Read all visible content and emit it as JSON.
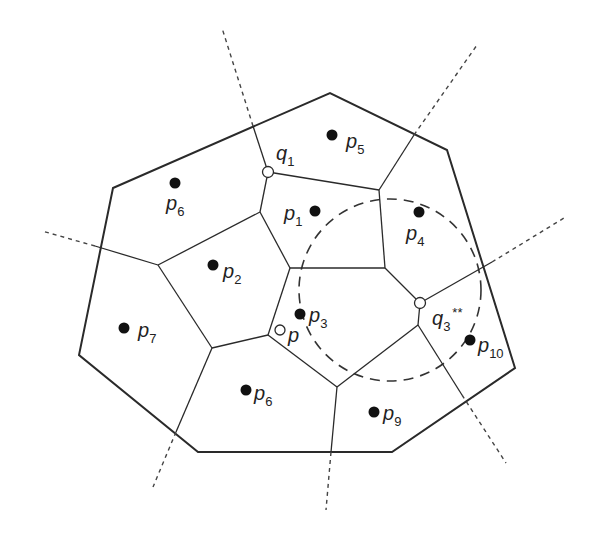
{
  "diagram": {
    "type": "voronoi",
    "colors": {
      "line": "#2a2a2a",
      "background": "#ffffff"
    },
    "sites": [
      {
        "id": "p5",
        "base": "p",
        "sub": "5",
        "x": 332,
        "y": 135,
        "lx": 346,
        "ly": 148
      },
      {
        "id": "p6a",
        "base": "p",
        "sub": "6",
        "x": 175,
        "y": 183,
        "lx": 166,
        "ly": 210
      },
      {
        "id": "p1",
        "base": "p",
        "sub": "1",
        "x": 315,
        "y": 211,
        "lx": 284,
        "ly": 220
      },
      {
        "id": "p4",
        "base": "p",
        "sub": "4",
        "x": 419,
        "y": 212,
        "lx": 406,
        "ly": 240
      },
      {
        "id": "p2",
        "base": "p",
        "sub": "2",
        "x": 213,
        "y": 265,
        "lx": 223,
        "ly": 278
      },
      {
        "id": "p3",
        "base": "p",
        "sub": "3",
        "x": 300,
        "y": 314,
        "lx": 309,
        "ly": 322
      },
      {
        "id": "p7",
        "base": "p",
        "sub": "7",
        "x": 124,
        "y": 328,
        "lx": 138,
        "ly": 337
      },
      {
        "id": "p10",
        "base": "p",
        "sub": "10",
        "x": 470,
        "y": 340,
        "lx": 478,
        "ly": 352
      },
      {
        "id": "p6b",
        "base": "p",
        "sub": "6",
        "x": 246,
        "y": 390,
        "lx": 254,
        "ly": 400
      },
      {
        "id": "p9",
        "base": "p",
        "sub": "9",
        "x": 374,
        "y": 412,
        "lx": 383,
        "ly": 420
      }
    ],
    "query_points": [
      {
        "id": "p",
        "label": "p",
        "x": 280,
        "y": 330,
        "lx": 288,
        "ly": 342
      }
    ],
    "vertices_marked": [
      {
        "id": "q1",
        "base": "q",
        "sub": "1",
        "sup": "",
        "x": 268,
        "y": 172,
        "lx": 276,
        "ly": 160
      },
      {
        "id": "q3",
        "base": "q",
        "sub": "3",
        "sup": "**",
        "x": 420,
        "y": 303,
        "lx": 432,
        "ly": 325
      }
    ],
    "hull_polygon": [
      [
        113,
        188
      ],
      [
        330,
        93
      ],
      [
        447,
        150
      ],
      [
        515,
        368
      ],
      [
        392,
        452
      ],
      [
        198,
        452
      ],
      [
        79,
        355
      ]
    ],
    "edges": [
      [
        [
          268,
          172
        ],
        [
          253,
          126
        ]
      ],
      [
        [
          268,
          172
        ],
        [
          379,
          190
        ]
      ],
      [
        [
          379,
          190
        ],
        [
          414,
          135
        ]
      ],
      [
        [
          268,
          172
        ],
        [
          260,
          212
        ]
      ],
      [
        [
          260,
          212
        ],
        [
          158,
          265
        ]
      ],
      [
        [
          158,
          265
        ],
        [
          95,
          246
        ]
      ],
      [
        [
          260,
          212
        ],
        [
          290,
          268
        ]
      ],
      [
        [
          379,
          190
        ],
        [
          385,
          268
        ]
      ],
      [
        [
          290,
          268
        ],
        [
          385,
          268
        ]
      ],
      [
        [
          385,
          268
        ],
        [
          420,
          303
        ]
      ],
      [
        [
          420,
          303
        ],
        [
          492,
          262
        ]
      ],
      [
        [
          290,
          268
        ],
        [
          268,
          335
        ]
      ],
      [
        [
          158,
          265
        ],
        [
          212,
          348
        ]
      ],
      [
        [
          212,
          348
        ],
        [
          268,
          335
        ]
      ],
      [
        [
          212,
          348
        ],
        [
          176,
          432
        ]
      ],
      [
        [
          268,
          335
        ],
        [
          337,
          387
        ]
      ],
      [
        [
          337,
          387
        ],
        [
          418,
          325
        ]
      ],
      [
        [
          418,
          325
        ],
        [
          420,
          303
        ]
      ],
      [
        [
          337,
          387
        ],
        [
          331,
          452
        ]
      ],
      [
        [
          418,
          325
        ],
        [
          462,
          395
        ]
      ]
    ],
    "dashed_rays": [
      [
        [
          253,
          126
        ],
        [
          222,
          28
        ]
      ],
      [
        [
          414,
          135
        ],
        [
          477,
          45
        ]
      ],
      [
        [
          95,
          246
        ],
        [
          42,
          231
        ]
      ],
      [
        [
          492,
          262
        ],
        [
          564,
          218
        ]
      ],
      [
        [
          462,
          395
        ],
        [
          506,
          463
        ]
      ],
      [
        [
          331,
          452
        ],
        [
          326,
          510
        ]
      ],
      [
        [
          176,
          432
        ],
        [
          153,
          487
        ]
      ]
    ],
    "circle": {
      "cx": 390,
      "cy": 290,
      "r": 91,
      "dash": "10,7"
    }
  }
}
